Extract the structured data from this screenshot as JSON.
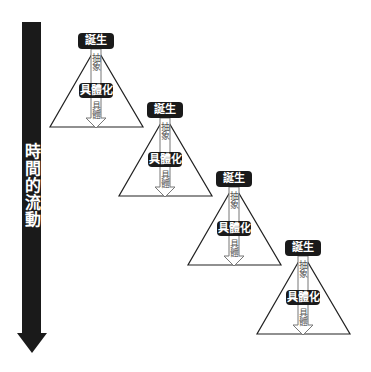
{
  "time_axis": {
    "label": "時間的流動",
    "color": "#1a1a1a"
  },
  "stages": [
    {
      "birth": "誕生",
      "abstract": "抽象",
      "concretize": "具體化",
      "concrete": "具體"
    },
    {
      "birth": "誕生",
      "abstract": "抽象",
      "concretize": "具體化",
      "concrete": "具體"
    },
    {
      "birth": "誕生",
      "abstract": "抽象",
      "concretize": "具體化",
      "concrete": "具體"
    },
    {
      "birth": "誕生",
      "abstract": "抽象",
      "concretize": "具體化",
      "concrete": "具體"
    }
  ],
  "colors": {
    "box": "#1a1a1a",
    "triangle_stroke": "#222222",
    "inner_arrow_stroke": "#777777"
  }
}
